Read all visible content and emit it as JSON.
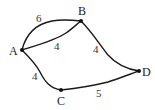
{
  "graph": {
    "nodes": [
      {
        "id": "A",
        "label": "A"
      },
      {
        "id": "B",
        "label": "B"
      },
      {
        "id": "C",
        "label": "C"
      },
      {
        "id": "D",
        "label": "D"
      }
    ],
    "edges": [
      {
        "from": "A",
        "to": "B",
        "weight": "6",
        "shape": "upper-arc"
      },
      {
        "from": "A",
        "to": "B",
        "weight": "4",
        "shape": "lower-arc"
      },
      {
        "from": "B",
        "to": "D",
        "weight": "4"
      },
      {
        "from": "A",
        "to": "C",
        "weight": "4"
      },
      {
        "from": "C",
        "to": "D",
        "weight": "5"
      }
    ],
    "colors": {
      "stroke": "#1a1a1a",
      "node": "#111111",
      "text": "#222222",
      "background": "#ffffff"
    }
  }
}
